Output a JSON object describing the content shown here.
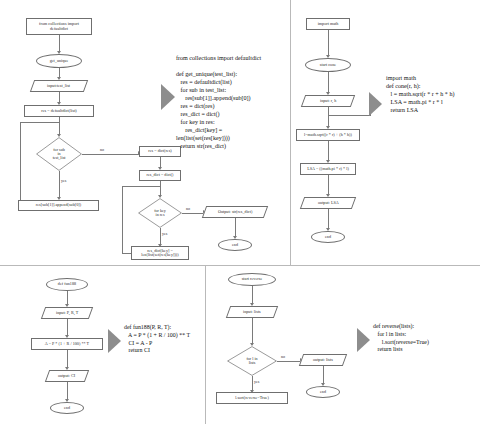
{
  "page": {
    "background": "#ffffff",
    "line_color": "#6f6f6f",
    "arrow_fill": "#8d8d8d"
  },
  "panels": [
    {
      "id": "panel-get-unique",
      "flowchart": {
        "nodes": [
          {
            "shape": "rect",
            "label": "from collections import\ndefaultdict"
          },
          {
            "shape": "oval",
            "label": "get_unique"
          },
          {
            "shape": "parallelogram",
            "label": "input:test_list"
          },
          {
            "shape": "rect",
            "label": "res = defaultdict(list)"
          },
          {
            "shape": "diamond",
            "label": "for sub\nin\ntest_list"
          },
          {
            "shape": "rect",
            "label": "res[sub[1]].append(sub[0])"
          },
          {
            "shape": "rect",
            "label": "res = dict(res)"
          },
          {
            "shape": "rect",
            "label": "res_dict = dict()"
          },
          {
            "shape": "diamond",
            "label": "for key\nin res"
          },
          {
            "shape": "rect",
            "label": "res_dict[key] =\nlen(list(set(res[key])))"
          },
          {
            "shape": "parallelogram",
            "label": "Output: str(res_dict)"
          },
          {
            "shape": "oval",
            "label": "end"
          }
        ],
        "edge_labels": {
          "no": "no",
          "yes": "yes"
        }
      },
      "code": "from collections import defaultdict\n\ndef get_unique(test_list):\n   res = defaultdict(list)\n   for sub in test_list:\n      res[sub[1]].append(sub[0])\n   res = dict(res)\n   res_dict = dict()\n   for key in res:\n      res_dict[key] =\nlen(list(set(res[key])))\n   return str(res_dict)"
    },
    {
      "id": "panel-cone",
      "flowchart": {
        "nodes": [
          {
            "shape": "rect",
            "label": "import math"
          },
          {
            "shape": "oval",
            "label": "start cone"
          },
          {
            "shape": "parallelogram",
            "label": "input: r, h"
          },
          {
            "shape": "rect",
            "label": "l=math.sqrt((r * r) + (h * h))"
          },
          {
            "shape": "rect",
            "label": "LSA = ((math.pi * r) * l)"
          },
          {
            "shape": "parallelogram",
            "label": "output: LSA"
          },
          {
            "shape": "oval",
            "label": "end"
          }
        ],
        "edge_labels": {}
      },
      "code": "import math\ndef cone(r, h):\n   l = math.sqrt(r * r + h * h)\n   LSA = math.pi * r * l\n   return LSA"
    },
    {
      "id": "panel-fun188",
      "flowchart": {
        "nodes": [
          {
            "shape": "oval",
            "label": "def fun188"
          },
          {
            "shape": "parallelogram",
            "label": "input: P, R, T"
          },
          {
            "shape": "rect",
            "label": "A = P * (1 + R / 100) ** T"
          },
          {
            "shape": "parallelogram",
            "label": "output: CI"
          },
          {
            "shape": "oval",
            "label": "end"
          }
        ],
        "edge_labels": {}
      },
      "code": "def fun188(P, R, T):\n   A = P * (1 + R / 100) ** T\n   CI = A - P\n   return CI"
    },
    {
      "id": "panel-reverse",
      "flowchart": {
        "nodes": [
          {
            "shape": "oval",
            "label": "start reverse"
          },
          {
            "shape": "parallelogram",
            "label": "input: lists"
          },
          {
            "shape": "diamond",
            "label": "for l in\nlists"
          },
          {
            "shape": "parallelogram",
            "label": "output: lists"
          },
          {
            "shape": "rect",
            "label": "l.sort(reverse=True)"
          },
          {
            "shape": "oval",
            "label": "end"
          }
        ],
        "edge_labels": {
          "no": "no",
          "yes": "yes"
        }
      },
      "code": "def reverse(lists):\n   for l in lists:\n      l.sort(reverse=True)\n   return lists"
    }
  ]
}
